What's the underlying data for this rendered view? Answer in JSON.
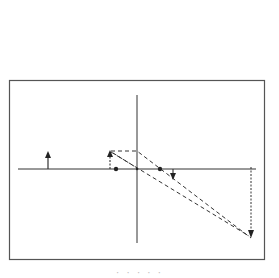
{
  "diagram": {
    "type": "ray-diagram",
    "colors": {
      "background": "#ffffff",
      "line": "#333333",
      "frame": "#555555"
    },
    "frame": {
      "x": 9,
      "y": 80,
      "width": 256,
      "height": 180
    },
    "optical_axis": {
      "x1": 18,
      "y1": 169,
      "x2": 256,
      "y2": 169
    },
    "lens": {
      "x": 137,
      "y1": 95,
      "y2": 243
    },
    "focal_points": [
      {
        "name": "focal-point-left",
        "x": 116,
        "y": 169
      },
      {
        "name": "focal-point-right",
        "x": 160,
        "y": 169
      }
    ],
    "arrows": [
      {
        "name": "object-arrow-far",
        "x": 48,
        "y_base": 169,
        "y_tip": 151,
        "style": "solid",
        "direction": "up"
      },
      {
        "name": "object-arrow-near",
        "x": 110,
        "y_base": 169,
        "y_tip": 150,
        "style": "dashed",
        "direction": "up"
      },
      {
        "name": "image-arrow-small",
        "x": 173,
        "y_base": 169,
        "y_tip": 180,
        "style": "solid",
        "direction": "down"
      },
      {
        "name": "image-arrow-large",
        "x": 251,
        "y_base": 167,
        "y_tip": 238,
        "style": "dotted",
        "direction": "down"
      }
    ],
    "rays": [
      {
        "name": "ray-parallel",
        "points": [
          [
            111,
            151
          ],
          [
            137,
            151
          ],
          [
            251,
            238
          ]
        ]
      },
      {
        "name": "ray-through-center",
        "points": [
          [
            111,
            151
          ],
          [
            251,
            238
          ]
        ]
      },
      {
        "name": "ray-focal",
        "points": [
          [
            111,
            151
          ],
          [
            137,
            168
          ],
          [
            250,
            236
          ]
        ]
      }
    ],
    "caption": "· · · · ·"
  }
}
